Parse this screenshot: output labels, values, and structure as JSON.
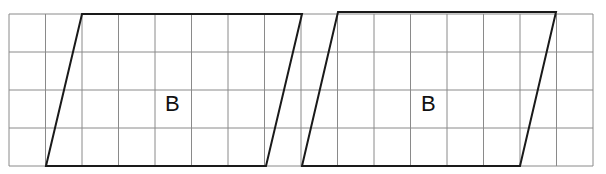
{
  "grid": {
    "columns": 16,
    "rows": 4,
    "origin_x": 9,
    "origin_y": 14,
    "cell_w": 36.5,
    "cell_h": 38,
    "line_color": "#8a8a8a"
  },
  "shapes": [
    {
      "name": "parallelogram-left",
      "label": "B",
      "points": "82,14 302,14 266,166 46,166"
    },
    {
      "name": "parallelogram-right",
      "label": "B",
      "points": "338,12 556,12 520,166 302,166"
    }
  ],
  "shape_stroke": "#1a1a1a"
}
